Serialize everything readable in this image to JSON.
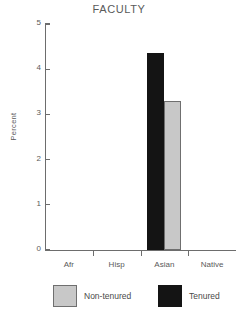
{
  "chart_data": {
    "type": "bar",
    "title": "FACULTY",
    "xlabel": "",
    "ylabel": "Percent",
    "categories": [
      "Afr",
      "Hisp",
      "Asian",
      "Native"
    ],
    "ylim": [
      0,
      5
    ],
    "yticks": [
      0,
      1,
      2,
      3,
      4,
      5
    ],
    "ytick_labels": [
      "0",
      "1",
      "2",
      "3",
      "4",
      "5"
    ],
    "grid": false,
    "legend_position": "bottom",
    "series": [
      {
        "name": "Non-tenured",
        "color": "#c8c8c8",
        "values": [
          0,
          0,
          3.3,
          0
        ]
      },
      {
        "name": "Tenured",
        "color": "#141414",
        "values": [
          0,
          0,
          4.35,
          0
        ]
      }
    ]
  },
  "legend": {
    "items": [
      {
        "label": "Non-tenured",
        "color": "#c8c8c8"
      },
      {
        "label": "Tenured",
        "color": "#141414"
      }
    ]
  }
}
